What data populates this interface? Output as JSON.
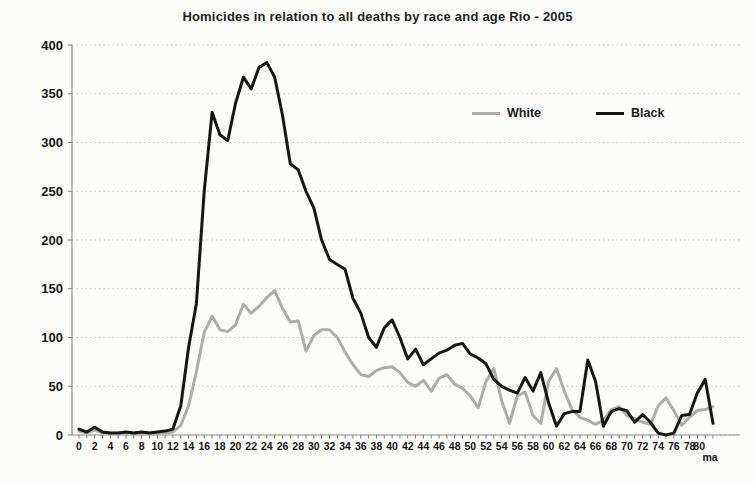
{
  "title": "Homicides in relation to all deaths by race and age Rio - 2005",
  "colors": {
    "background": "#fcfcfa",
    "grid": "#c7c7c3",
    "axis": "#8f8f8c",
    "text": "#161616",
    "white_series": "#adadab",
    "black_series": "#161616"
  },
  "legend": {
    "position": "top-right-inside",
    "items": [
      {
        "label": "White"
      },
      {
        "label": "Black"
      }
    ]
  },
  "chart_data": {
    "type": "line",
    "title": "Homicides in relation to all deaths by race and age Rio - 2005",
    "xlabel": "",
    "ylabel": "",
    "ylim": [
      0,
      400
    ],
    "y_tick_step": 50,
    "x_tick_label_every": 2,
    "grid": "dotted-horizontal",
    "legend_position": "top-right-inside",
    "x_axis_note": "ages 0 to 80 plus final category 'ma' (80 and more)",
    "categories": [
      "0",
      "1",
      "2",
      "3",
      "4",
      "5",
      "6",
      "7",
      "8",
      "9",
      "10",
      "11",
      "12",
      "13",
      "14",
      "15",
      "16",
      "17",
      "18",
      "19",
      "20",
      "21",
      "22",
      "23",
      "24",
      "25",
      "26",
      "27",
      "28",
      "29",
      "30",
      "31",
      "32",
      "33",
      "34",
      "35",
      "36",
      "37",
      "38",
      "39",
      "40",
      "41",
      "42",
      "43",
      "44",
      "45",
      "46",
      "47",
      "48",
      "49",
      "50",
      "51",
      "52",
      "53",
      "54",
      "55",
      "56",
      "57",
      "58",
      "59",
      "60",
      "61",
      "62",
      "63",
      "64",
      "65",
      "66",
      "67",
      "68",
      "69",
      "70",
      "71",
      "72",
      "73",
      "74",
      "75",
      "76",
      "77",
      "78",
      "79",
      "80",
      "ma"
    ],
    "series": [
      {
        "name": "White",
        "color": "#adadab",
        "values": [
          4,
          2,
          5,
          2,
          2,
          2,
          2,
          2,
          2,
          2,
          2,
          2,
          3,
          10,
          30,
          65,
          105,
          122,
          108,
          106,
          113,
          134,
          125,
          132,
          141,
          148,
          130,
          116,
          117,
          86,
          102,
          108,
          108,
          100,
          85,
          72,
          62,
          60,
          66,
          69,
          70,
          64,
          54,
          50,
          56,
          45,
          58,
          62,
          52,
          48,
          40,
          28,
          55,
          68,
          35,
          12,
          40,
          44,
          20,
          12,
          55,
          68,
          45,
          26,
          18,
          15,
          11,
          15,
          26,
          29,
          20,
          17,
          13,
          11,
          30,
          38,
          25,
          10,
          18,
          25,
          26,
          29
        ]
      },
      {
        "name": "Black",
        "color": "#161616",
        "values": [
          6,
          3,
          8,
          3,
          2,
          2,
          3,
          2,
          3,
          2,
          3,
          4,
          6,
          30,
          90,
          135,
          250,
          331,
          308,
          302,
          340,
          367,
          355,
          377,
          382,
          367,
          328,
          278,
          272,
          250,
          233,
          200,
          180,
          175,
          170,
          140,
          125,
          100,
          90,
          110,
          118,
          100,
          78,
          88,
          72,
          78,
          84,
          87,
          92,
          94,
          83,
          79,
          73,
          57,
          50,
          46,
          43,
          59,
          45,
          64,
          33,
          9,
          22,
          24,
          24,
          77,
          55,
          9,
          24,
          27,
          25,
          13,
          21,
          13,
          2,
          0,
          2,
          20,
          21,
          43,
          57,
          12
        ]
      }
    ]
  }
}
